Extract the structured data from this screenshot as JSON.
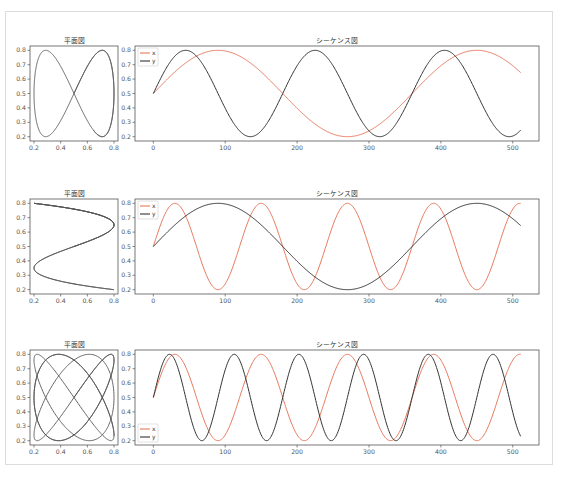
{
  "figure": {
    "rows": 3,
    "caption_text": ""
  },
  "colors": {
    "x": "#e87a5f",
    "y": "#333333",
    "plane": "#555555",
    "axis": "#555555"
  },
  "chart_data": [
    {
      "type": "line",
      "panel": "plane",
      "row": 1,
      "title": "平面図",
      "xlabel": "",
      "ylabel": "",
      "xlim": [
        0.17,
        0.83
      ],
      "ylim": [
        0.17,
        0.83
      ],
      "xticks": [
        "0.2",
        "0.4",
        "0.6",
        "0.8"
      ],
      "yticks": [
        "0.2",
        "0.3",
        "0.4",
        "0.5",
        "0.6",
        "0.7",
        "0.8"
      ],
      "description": "Parametric curve (x, y) — figure-eight Lissajous (ratio 1:2)",
      "x_param": {
        "offset": 0.5,
        "amplitude": 0.3,
        "period": 360
      },
      "y_param": {
        "offset": 0.5,
        "amplitude": 0.3,
        "period": 180
      },
      "t_range": [
        0,
        511
      ]
    },
    {
      "type": "line",
      "panel": "sequence",
      "row": 1,
      "title": "シーケンス図",
      "xlabel": "",
      "ylabel": "",
      "xlim": [
        -25.5,
        536.5
      ],
      "ylim": [
        0.17,
        0.83
      ],
      "xticks": [
        "0",
        "100",
        "200",
        "300",
        "400",
        "500"
      ],
      "yticks": [
        "0.2",
        "0.3",
        "0.4",
        "0.5",
        "0.6",
        "0.7",
        "0.8"
      ],
      "legend": [
        "x",
        "y"
      ],
      "legend_position": "upper left",
      "series": [
        {
          "name": "x",
          "formula": "0.5+0.3*sin(2*pi*t/360)",
          "period": 360,
          "offset": 0.5,
          "amplitude": 0.3,
          "sample_t": [
            0,
            45,
            90,
            135,
            180,
            225,
            270,
            315,
            360,
            405,
            450,
            495,
            511
          ],
          "sample_values": [
            0.5,
            0.71,
            0.8,
            0.71,
            0.5,
            0.29,
            0.2,
            0.29,
            0.5,
            0.71,
            0.8,
            0.71,
            0.65
          ]
        },
        {
          "name": "y",
          "formula": "0.5+0.3*sin(2*pi*t/180)",
          "period": 180,
          "offset": 0.5,
          "amplitude": 0.3,
          "sample_t": [
            0,
            45,
            90,
            135,
            180,
            225,
            270,
            315,
            360,
            405,
            450,
            495,
            511
          ],
          "sample_values": [
            0.5,
            0.8,
            0.5,
            0.2,
            0.5,
            0.8,
            0.5,
            0.2,
            0.5,
            0.8,
            0.5,
            0.2,
            0.26
          ]
        }
      ]
    },
    {
      "type": "line",
      "panel": "plane",
      "row": 2,
      "title": "平面図",
      "xlim": [
        0.17,
        0.83
      ],
      "ylim": [
        0.17,
        0.83
      ],
      "xticks": [
        "0.2",
        "0.4",
        "0.6",
        "0.8"
      ],
      "yticks": [
        "0.2",
        "0.3",
        "0.4",
        "0.5",
        "0.6",
        "0.7",
        "0.8"
      ],
      "description": "Parametric curve (x, y) — S-shaped Lissajous (ratio 3:1)",
      "x_param": {
        "offset": 0.5,
        "amplitude": 0.3,
        "period": 120
      },
      "y_param": {
        "offset": 0.5,
        "amplitude": 0.3,
        "period": 360
      },
      "t_range": [
        0,
        511
      ]
    },
    {
      "type": "line",
      "panel": "sequence",
      "row": 2,
      "title": "シーケンス図",
      "xlim": [
        -25.5,
        536.5
      ],
      "ylim": [
        0.17,
        0.83
      ],
      "xticks": [
        "0",
        "100",
        "200",
        "300",
        "400",
        "500"
      ],
      "yticks": [
        "0.2",
        "0.3",
        "0.4",
        "0.5",
        "0.6",
        "0.7",
        "0.8"
      ],
      "legend": [
        "x",
        "y"
      ],
      "legend_position": "upper left",
      "series": [
        {
          "name": "x",
          "formula": "0.5+0.3*sin(2*pi*t/120)",
          "period": 120,
          "offset": 0.5,
          "amplitude": 0.3,
          "sample_t": [
            0,
            30,
            60,
            90,
            120,
            150,
            180,
            210,
            240,
            270,
            300,
            330,
            360,
            390,
            420,
            450,
            480,
            511
          ],
          "sample_values": [
            0.5,
            0.8,
            0.5,
            0.2,
            0.5,
            0.8,
            0.5,
            0.2,
            0.5,
            0.8,
            0.5,
            0.2,
            0.5,
            0.8,
            0.5,
            0.2,
            0.5,
            0.8
          ]
        },
        {
          "name": "y",
          "formula": "0.5+0.3*sin(2*pi*t/360)",
          "period": 360,
          "offset": 0.5,
          "amplitude": 0.3,
          "sample_t": [
            0,
            90,
            180,
            270,
            360,
            450,
            511
          ],
          "sample_values": [
            0.5,
            0.8,
            0.5,
            0.2,
            0.5,
            0.8,
            0.65
          ]
        }
      ]
    },
    {
      "type": "line",
      "panel": "plane",
      "row": 3,
      "title": "平面図",
      "xlim": [
        0.17,
        0.83
      ],
      "ylim": [
        0.17,
        0.83
      ],
      "xticks": [
        "0.2",
        "0.4",
        "0.6",
        "0.8"
      ],
      "yticks": [
        "0.2",
        "0.3",
        "0.4",
        "0.5",
        "0.6",
        "0.7",
        "0.8"
      ],
      "description": "Parametric curve (x, y) — Lissajous lattice (ratio 3:4)",
      "x_param": {
        "offset": 0.5,
        "amplitude": 0.3,
        "period": 120
      },
      "y_param": {
        "offset": 0.5,
        "amplitude": 0.3,
        "period": 90
      },
      "t_range": [
        0,
        511
      ]
    },
    {
      "type": "line",
      "panel": "sequence",
      "row": 3,
      "title": "シーケンス図",
      "xlim": [
        -25.5,
        536.5
      ],
      "ylim": [
        0.17,
        0.83
      ],
      "xticks": [
        "0",
        "100",
        "200",
        "300",
        "400",
        "500"
      ],
      "yticks": [
        "0.2",
        "0.3",
        "0.4",
        "0.5",
        "0.6",
        "0.7",
        "0.8"
      ],
      "legend": [
        "x",
        "y"
      ],
      "legend_position": "lower left",
      "series": [
        {
          "name": "x",
          "formula": "0.5+0.3*sin(2*pi*t/120)",
          "period": 120,
          "offset": 0.5,
          "amplitude": 0.3,
          "sample_t": [
            0,
            30,
            90,
            150,
            210,
            270,
            330,
            390,
            450,
            511
          ],
          "sample_values": [
            0.5,
            0.8,
            0.2,
            0.8,
            0.2,
            0.8,
            0.2,
            0.8,
            0.2,
            0.8
          ]
        },
        {
          "name": "y",
          "formula": "0.5+0.3*sin(2*pi*t/90)",
          "period": 90,
          "offset": 0.5,
          "amplitude": 0.3,
          "sample_t": [
            0,
            22.5,
            67.5,
            112.5,
            157.5,
            202.5,
            247.5,
            292.5,
            337.5,
            382.5,
            427.5,
            472.5,
            511
          ],
          "sample_values": [
            0.5,
            0.8,
            0.2,
            0.8,
            0.2,
            0.8,
            0.2,
            0.8,
            0.2,
            0.8,
            0.2,
            0.8,
            0.22
          ]
        }
      ]
    }
  ]
}
